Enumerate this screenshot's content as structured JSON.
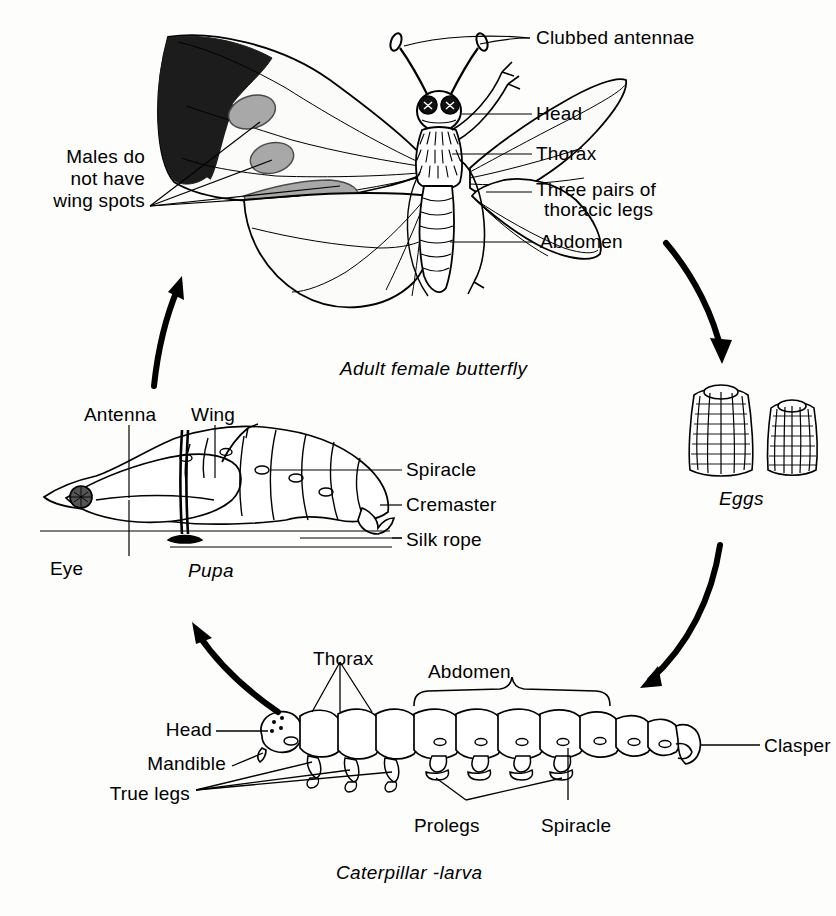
{
  "diagram": {
    "background_color": "#fdfdfc",
    "ink_color": "#000000",
    "wing_tip_color": "#1a1a1a",
    "wing_spot_color": "#a8a8a8",
    "stages": [
      {
        "id": "adult",
        "caption": "Adult female butterfly"
      },
      {
        "id": "eggs",
        "caption": "Eggs"
      },
      {
        "id": "larva",
        "caption": "Caterpillar -larva"
      },
      {
        "id": "pupa",
        "caption": "Pupa"
      }
    ],
    "adult_labels": {
      "antennae": "Clubbed antennae",
      "head": "Head",
      "thorax": "Thorax",
      "legs_line1": "Three pairs of",
      "legs_line2": "thoracic legs",
      "abdomen": "Abdomen",
      "males_line1": "Males do",
      "males_line2": "not have",
      "males_line3": "wing spots"
    },
    "pupa_labels": {
      "antenna": "Antenna",
      "wing": "Wing",
      "eye": "Eye",
      "spiracle": "Spiracle",
      "cremaster": "Cremaster",
      "silk_rope": "Silk rope"
    },
    "larva_labels": {
      "thorax": "Thorax",
      "abdomen": "Abdomen",
      "head": "Head",
      "mandible": "Mandible",
      "true_legs": "True legs",
      "prolegs": "Prolegs",
      "spiracle": "Spiracle",
      "clasper": "Clasper"
    },
    "cycle_arrows": [
      {
        "id": "adult-to-eggs",
        "from": "adult",
        "to": "eggs"
      },
      {
        "id": "eggs-to-larva",
        "from": "eggs",
        "to": "larva"
      },
      {
        "id": "larva-to-pupa",
        "from": "larva",
        "to": "pupa"
      },
      {
        "id": "pupa-to-adult",
        "from": "pupa",
        "to": "adult"
      }
    ]
  }
}
